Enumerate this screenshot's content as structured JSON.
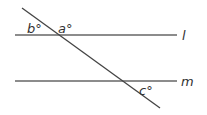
{
  "diagram": {
    "type": "parallel-lines-transversal",
    "lines": [
      {
        "id": "l",
        "label": "l",
        "x1": 15,
        "y1": 35,
        "x2": 177,
        "y2": 35
      },
      {
        "id": "m",
        "label": "m",
        "x1": 15,
        "y1": 81,
        "x2": 177,
        "y2": 81
      }
    ],
    "transversal": {
      "x1": 22,
      "y1": 8,
      "x2": 160,
      "y2": 108
    },
    "angles": [
      {
        "label": "b°",
        "x": 28,
        "y": 33
      },
      {
        "label": "a°",
        "x": 58,
        "y": 33
      },
      {
        "label": "c°",
        "x": 140,
        "y": 95
      }
    ],
    "colors": {
      "line": "#555555",
      "text": "#333333",
      "background": "#ffffff"
    }
  }
}
